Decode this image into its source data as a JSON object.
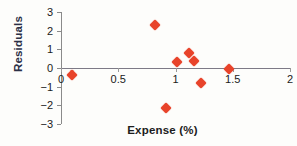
{
  "chart_data": {
    "type": "scatter",
    "title": "",
    "xlabel": "Expense (%)",
    "ylabel": "Residuals",
    "xlim": [
      0,
      2
    ],
    "ylim": [
      -3,
      3
    ],
    "xticks": [
      "0",
      "0.5",
      "1",
      "1.5",
      "2"
    ],
    "xtick_values": [
      0,
      0.5,
      1,
      1.5,
      2
    ],
    "yticks": [
      "3",
      "2",
      "1",
      "0",
      "−1",
      "−2",
      "−3"
    ],
    "ytick_values": [
      3,
      2,
      1,
      0,
      -1,
      -2,
      -3
    ],
    "grid": false,
    "legend": "none",
    "marker_shape": "diamond",
    "marker_color": "#e8432a",
    "reference_line": {
      "axis": "horizontal",
      "value": 0
    },
    "points": [
      {
        "x": 0.1,
        "y": -0.35
      },
      {
        "x": 0.82,
        "y": 2.3
      },
      {
        "x": 0.92,
        "y": -2.15
      },
      {
        "x": 1.01,
        "y": 0.3
      },
      {
        "x": 1.12,
        "y": 0.8
      },
      {
        "x": 1.16,
        "y": 0.4
      },
      {
        "x": 1.22,
        "y": -0.8
      },
      {
        "x": 1.47,
        "y": -0.05
      }
    ]
  }
}
